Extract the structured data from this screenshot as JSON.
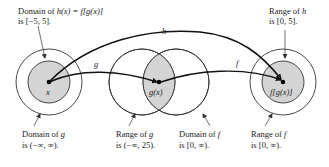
{
  "diagram": {
    "annotations": {
      "domain_h": {
        "line1": "Domain of ",
        "fn": "h(x) = f[g(x)]",
        "line2": "is [−5, 5]."
      },
      "range_h": {
        "line1": "Range of ",
        "fn": "h",
        "line2": "is [0, 5]."
      },
      "domain_g": {
        "line1": "Domain of ",
        "fn": "g",
        "line2": "is (−∞, ∞)."
      },
      "range_g": {
        "line1": "Range of ",
        "fn": "g",
        "line2": "is (−∞, 25)."
      },
      "domain_f": {
        "line1": "Domain of ",
        "fn": "f",
        "line2": "is [0, ∞)."
      },
      "range_f": {
        "line1": "Range of ",
        "fn": "f",
        "line2": "is [0, ∞)."
      }
    },
    "points": {
      "x": "x",
      "gx": "g(x)",
      "fgx": "f[g(x)]"
    },
    "arrows": {
      "g": "g",
      "f": "f",
      "h": "h"
    },
    "colors": {
      "shade": "#d4d4d4",
      "stroke": "#333333",
      "arrow": "#111111"
    }
  }
}
